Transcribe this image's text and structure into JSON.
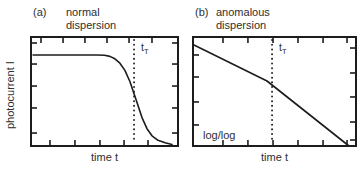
{
  "figure": {
    "background": "#ffffff",
    "line_color": "#1c1c1c",
    "text_color": "#2e2e2e"
  },
  "chart_data": [
    {
      "id": "a",
      "type": "line",
      "panel_tag": "(a)",
      "title": "normal dispersion",
      "title_lines": [
        "normal",
        "dispersion"
      ],
      "xlabel": "time t",
      "ylabel": "photocurrent I",
      "axes_note": "schematic linear axes, closed box frame, inward unlabeled ticks, no numeric values",
      "marker": {
        "label_base": "t",
        "label_sub": "T",
        "x": 0.701,
        "style": "dotted vertical line"
      },
      "series": [
        {
          "name": "photocurrent plateau with sigmoidal drop at transit time",
          "coords": "normalized: x 0-1 left to right, y 0-1 bottom to top",
          "points": [
            [
              0.014,
              0.835
            ],
            [
              0.45,
              0.835
            ],
            [
              0.5,
              0.833
            ],
            [
              0.537,
              0.822
            ],
            [
              0.571,
              0.8
            ],
            [
              0.605,
              0.76
            ],
            [
              0.639,
              0.694
            ],
            [
              0.673,
              0.592
            ],
            [
              0.714,
              0.427
            ],
            [
              0.755,
              0.261
            ],
            [
              0.789,
              0.159
            ],
            [
              0.823,
              0.094
            ],
            [
              0.864,
              0.052
            ],
            [
              0.912,
              0.03
            ],
            [
              0.959,
              0.013
            ]
          ]
        }
      ],
      "layout": {
        "frame": "box",
        "legend": "none",
        "ticks_top": [
          0.068,
          0.218,
          0.367,
          0.517,
          0.667,
          0.823
        ],
        "ticks_bottom": [
          0.129,
          0.299,
          0.469,
          0.633,
          0.796
        ],
        "ticks_left": [
          0.055,
          0.248,
          0.45,
          0.651,
          0.881
        ],
        "ticks_right": [
          0.055,
          0.248,
          0.45,
          0.651,
          0.881
        ]
      }
    },
    {
      "id": "b",
      "type": "line",
      "panel_tag": "(b)",
      "title": "anomalous dispersion",
      "title_lines": [
        "anomalous",
        "dispersion"
      ],
      "xlabel": "time t",
      "ylabel": "",
      "scale_note": "log/log",
      "axes_note": "schematic log-log axes, closed box frame, inward unlabeled ticks, no numeric values",
      "marker": {
        "label_base": "t",
        "label_sub": "T",
        "x": 0.485,
        "style": "dotted vertical line"
      },
      "series": [
        {
          "name": "two power-law slopes with kink at transit time",
          "coords": "normalized: x 0-1 left to right, y 0-1 bottom to top",
          "points": [
            [
              0.006,
              0.927
            ],
            [
              0.454,
              0.596
            ],
            [
              0.957,
              0.0
            ]
          ]
        }
      ],
      "layout": {
        "frame": "box",
        "legend": "none",
        "ticks_top": [
          0.184,
          0.337,
          0.491,
          0.644,
          0.798,
          0.945
        ],
        "ticks_bottom": [
          0.184,
          0.337,
          0.491,
          0.644,
          0.798,
          0.945
        ],
        "ticks_left": [
          0.165,
          0.367,
          0.596,
          0.807
        ],
        "ticks_right": [
          0.101,
          0.33,
          0.55,
          0.78,
          0.945
        ]
      }
    }
  ]
}
